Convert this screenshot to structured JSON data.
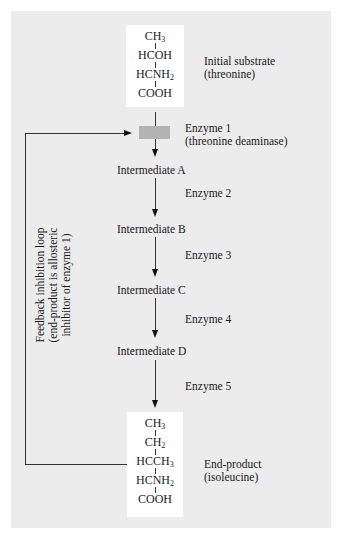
{
  "diagram": {
    "initial_substrate": {
      "formula_rows": [
        {
          "main": "CH",
          "sub": "3"
        },
        {
          "main": "HCOH",
          "sub": ""
        },
        {
          "main": "HCNH",
          "sub": "2"
        },
        {
          "main": "COOH",
          "sub": ""
        }
      ],
      "label_line1": "Initial substrate",
      "label_line2": "(threonine)"
    },
    "enzymes": [
      {
        "name": "Enzyme 1",
        "detail": "(threonine deaminase)"
      },
      {
        "name": "Enzyme 2"
      },
      {
        "name": "Enzyme 3"
      },
      {
        "name": "Enzyme 4"
      },
      {
        "name": "Enzyme 5"
      }
    ],
    "intermediates": [
      "Intermediate A",
      "Intermediate B",
      "Intermediate C",
      "Intermediate D"
    ],
    "end_product": {
      "formula_rows": [
        {
          "main": "CH",
          "sub": "3"
        },
        {
          "main": "CH",
          "sub": "2"
        },
        {
          "main": "HCCH",
          "sub": "3"
        },
        {
          "main": "HCNH",
          "sub": "2"
        },
        {
          "main": "COOH",
          "sub": ""
        }
      ],
      "label_line1": "End-product",
      "label_line2": "(isoleucine)"
    },
    "feedback_loop": {
      "line1": "Feedback inhibition loop",
      "line2": "(end-product is allosteric",
      "line3": "inhibitor of enzyme 1)"
    },
    "colors": {
      "panel_background": "#ececec",
      "molecule_box": "#ffffff",
      "enzyme_marker": "#b3b3b3",
      "lines": "#333333"
    }
  }
}
